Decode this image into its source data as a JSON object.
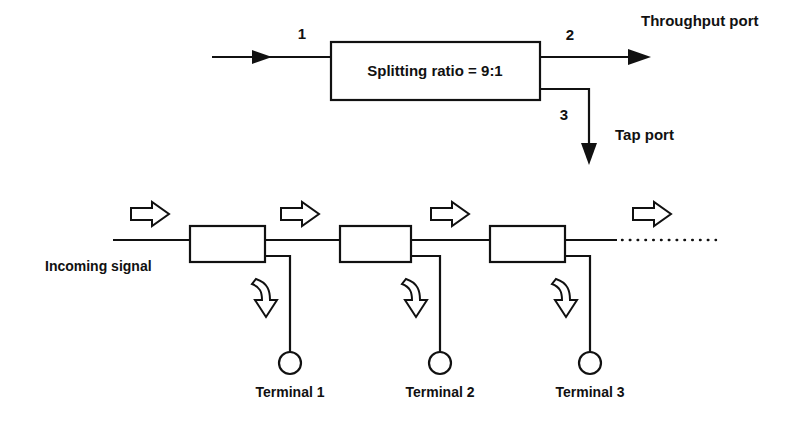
{
  "figure": {
    "background_color": "#ffffff",
    "ink_color": "#111111"
  },
  "upper_diagram": {
    "name": "single-tap-coupler",
    "coupler_box": {
      "label": "Splitting ratio = 9:1",
      "splitting_ratio": "9:1"
    },
    "ports": [
      {
        "number": "1",
        "role": "input",
        "label": ""
      },
      {
        "number": "2",
        "role": "throughput",
        "label": "Throughput port"
      },
      {
        "number": "3",
        "role": "tap",
        "label": "Tap port"
      }
    ],
    "port_1_number": "1",
    "port_2_number": "2",
    "port_3_number": "3",
    "throughput_label": "Throughput port",
    "tap_label": "Tap port"
  },
  "lower_diagram": {
    "name": "bus-network-with-taps",
    "incoming_label": "Incoming signal",
    "continuation": "dotted-line",
    "couplers": [
      {
        "index": 1,
        "terminal": "Terminal 1"
      },
      {
        "index": 2,
        "terminal": "Terminal 2"
      },
      {
        "index": 3,
        "terminal": "Terminal 3"
      }
    ],
    "terminals": [
      "Terminal 1",
      "Terminal 2",
      "Terminal 3"
    ],
    "terminal_1": "Terminal 1",
    "terminal_2": "Terminal 2",
    "terminal_3": "Terminal 3",
    "propagation_arrows_count": 4,
    "tap_arrows_count": 3
  },
  "icons": {
    "block_arrow_right": "block-arrow-right-icon",
    "curved_arrow_down": "curved-arrow-down-icon",
    "solid_arrow_right": "solid-arrowhead-right-icon",
    "solid_arrow_down": "solid-arrowhead-down-icon",
    "terminal_node": "terminal-circle-icon"
  }
}
